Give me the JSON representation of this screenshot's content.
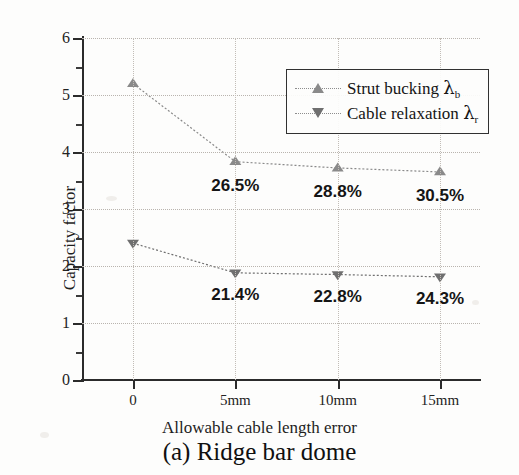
{
  "chart_data": {
    "type": "line",
    "title": "",
    "caption": "(a) Ridge bar dome",
    "xlabel": "Allowable cable length error",
    "ylabel": "Capacity factor",
    "categories": [
      "0",
      "5mm",
      "10mm",
      "15mm"
    ],
    "ylim": [
      0,
      6
    ],
    "yticks": [
      0,
      1,
      2,
      3,
      4,
      5,
      6
    ],
    "ytick_labels": [
      "0",
      "1",
      "2",
      "3",
      "4",
      "5",
      "6"
    ],
    "yminor_step": 0.5,
    "grid": "dotted-both-axes",
    "legend_position": "upper-right-inside",
    "series": [
      {
        "name": "Strut bucking λ_b",
        "label_main": "Strut bucking",
        "label_symbol": "λ",
        "label_subscript": "b",
        "marker": "triangle-up",
        "color": "#8a8a8a",
        "values": [
          5.2,
          3.83,
          3.72,
          3.65
        ],
        "annotations": [
          "",
          "26.5%",
          "28.8%",
          "30.5%"
        ]
      },
      {
        "name": "Cable relaxation λ_r",
        "label_main": "Cable relaxation",
        "label_symbol": "λ",
        "label_subscript": "r",
        "marker": "triangle-down",
        "color": "#6f6f6f",
        "values": [
          2.4,
          1.88,
          1.85,
          1.81
        ],
        "annotations": [
          "",
          "21.4%",
          "22.8%",
          "24.3%"
        ]
      }
    ]
  },
  "colors": {
    "axis": "#2b2b2b",
    "grid": "#b9b4ae",
    "series_upper": "#8a8a8a",
    "series_lower": "#6f6f6f",
    "background": "#fdfdfc",
    "text": "#1a1a1a"
  }
}
